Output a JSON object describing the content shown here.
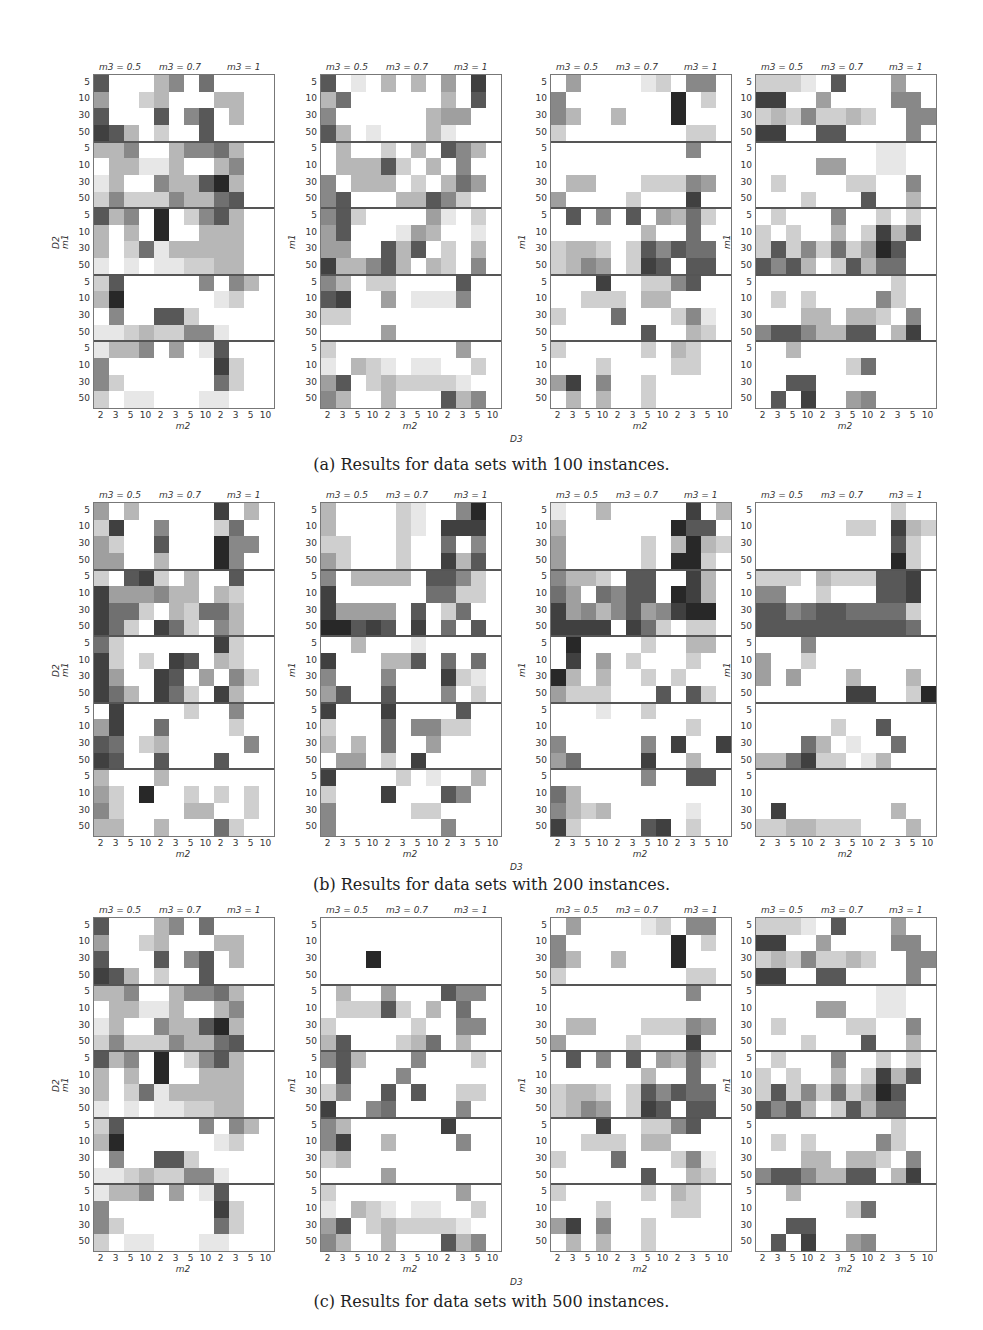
{
  "chart_data": {
    "type": "heatmap",
    "x_axis": {
      "label": "m2",
      "tick_labels": [
        "2",
        "3",
        "5",
        "10",
        "2",
        "3",
        "5",
        "10",
        "2",
        "3",
        "5",
        "10"
      ],
      "groups": [
        "m3 = 0.5",
        "m3 = 0.7",
        "m3 = 1"
      ]
    },
    "y_axis": {
      "label": "m1",
      "outer_label": "D2",
      "tick_labels": [
        "5",
        "10",
        "30",
        "50"
      ],
      "blocks": 5
    },
    "shared_xlabel": "D3",
    "figures": [
      {
        "id": "a",
        "caption": "(a) Results for data sets with 100 instances.",
        "panels": [
          {
            "rows": [
              "700035060000",
              "400230003300",
              "700070570300",
              "873020070000",
              "335003556300",
              "033113003500",
              "130053379300",
              "252225336700",
              "735090257300",
              "303090033300",
              "302613333300",
              "101011223300",
              "270000050530",
              "390000001200",
              "050077200000",
              "112322551000",
              "133504017000",
              "500000008200",
              "520000006200",
              "201100011000"
            ]
          },
          {
            "rows": [
              "701030304080",
              "360000003070",
              "500000034400",
              "730100031000",
              "030020307530",
              "033372030500",
              "503330203640",
              "570003375200",
              "572000041020",
              "470001430010",
              "440073702030",
              "833573032050",
              "530220000700",
              "780040111500",
              "220000000000",
              "000040000000",
              "200000000400",
              "103210110020",
              "470232222100",
              "530030007350"
            ]
          },
          {
            "rows": [
              "040000120550",
              "500000009020",
              "530030009000",
              "200000000220",
              "000000000500",
              "000000000000",
              "033000222540",
              "400002000800",
              "070507043620",
              "000000300600",
              "233202757660",
              "235402870770",
              "000800225700",
              "002220330000",
              "200060002510",
              "000000700320",
              "200000203200",
              "000200002200",
              "480500200000",
              "030300200000"
            ]
          },
          {
            "rows": [
              "222107000400",
              "880040000550",
              "232522320055",
              "880077000050",
              "000000001100",
              "000044001100",
              "020000220050",
              "000200070030",
              "020005002020",
              "202003028370",
              "272526249700",
              "757302736600",
              "000000000200",
              "020200005200",
              "000330332050",
              "577533770380",
              "003000000000",
              "000000260000",
              "007700000000",
              "070800450000"
            ]
          }
        ]
      },
      {
        "id": "b",
        "caption": "(b) Results for data sets with 200 instances.",
        "panels": [
          {
            "rows": [
              "403000008030",
              "280050002600",
              "420070009550",
              "440030009500",
              "207820300700",
              "844453303200",
              "866203266300",
              "862086205300",
              "620000008200",
              "820208703200",
              "840087040520",
              "863086208300",
              "080000200500",
              "480060000200",
              "760230000050",
              "870070007000",
              "300030000000",
              "420900202020",
              "520000330020",
              "330030006200"
            ]
          },
          {
            "rows": [
              "300002100590",
              "300002108880",
              "220002006050",
              "420002008370",
              "503333077520",
              "800000066220",
              "844440702600",
              "997870806070",
              "003000100000",
              "800033706060",
              "500050008210",
              "470070005020",
              "800080000700",
              "200060552200",
              "303060040000",
              "044020800000",
              "800002010030",
              "200080007500",
              "500000220000",
              "500000005000"
            ]
          },
          {
            "rows": [
              "100300000803",
              "300000009770",
              "400000203932",
              "400000209920",
              "533207700830",
              "640657709830",
              "845357458990",
              "888808620220",
              "090000200330",
              "080402000200",
              "930300202000",
              "422200070720",
              "000100200000",
              "000000000200",
              "500000508008",
              "460000800300",
              "000000500770",
              "630000000000",
              "532300000100",
              "820000780200"
            ]
          },
          {
            "rows": [
              "000000000200",
              "000000220832",
              "000000000720",
              "000000000920",
              "222032227780",
              "550020007780",
              "775677666620",
              "777777777760",
              "000500000000",
              "400200000000",
              "404000300030",
              "000000880029",
              "000000000000",
              "000002007000",
              "000630100600",
              "336822013000",
              "000000000000",
              "000000000000",
              "080000000300",
              "223322200030"
            ]
          }
        ]
      },
      {
        "id": "c",
        "caption": "(c) Results for data sets with 500 instances.",
        "panels": [
          {
            "rows": [
              "700035060000",
              "400230003300",
              "700070570300",
              "873020070000",
              "335003556300",
              "033113003500",
              "130053379300",
              "252225336700",
              "735090257300",
              "303090033300",
              "302613333300",
              "101011223300",
              "270000050530",
              "390000001200",
              "050077200000",
              "112322551000",
              "133504017000",
              "500000008200",
              "520000006200",
              "201100011000"
            ]
          },
          {
            "rows": [
              "000000000000",
              "000000000000",
              "000900000000",
              "000000000000",
              "030040007550",
              "022272030600",
              "200000200550",
              "370002360300",
              "573000500020",
              "070005000000",
              "250070700220",
              "800560000500",
              "530000008000",
              "580030000500",
              "230000000000",
              "000040000000",
              "200000000400",
              "103210110020",
              "470232222100",
              "530030007350"
            ]
          },
          {
            "rows": [
              "040000120550",
              "500000009020",
              "530030009000",
              "200000000220",
              "000000000500",
              "000000000000",
              "033000222540",
              "400002000800",
              "070507043620",
              "000000300600",
              "233202757660",
              "235402870770",
              "000800225700",
              "002220330000",
              "200060002510",
              "000000700320",
              "200000203200",
              "000200002200",
              "480500200000",
              "030300200000"
            ]
          },
          {
            "rows": [
              "222107000400",
              "880040000550",
              "232522320055",
              "880077000050",
              "000000001100",
              "000044001100",
              "020000220050",
              "000200070030",
              "020005002020",
              "202003028370",
              "272526249700",
              "757302736600",
              "000000000200",
              "020200005200",
              "000330332050",
              "577533770380",
              "003000000000",
              "000000260000",
              "007700000000",
              "070800450000"
            ]
          }
        ]
      }
    ]
  },
  "labels": {
    "m3_groups": [
      "m3 = 0.5",
      "m3 = 0.7",
      "m3 = 1"
    ],
    "x_ticks": [
      "2",
      "3",
      "5",
      "10",
      "2",
      "3",
      "5",
      "10",
      "2",
      "3",
      "5",
      "10"
    ],
    "y_ticks": [
      "5",
      "10",
      "30",
      "50"
    ],
    "x_title": "m2",
    "y_title": "m1",
    "outer_y_title": "D2",
    "bottom_title": "D3"
  },
  "captions": {
    "a": "(a) Results for data sets with 100 instances.",
    "b": "(b) Results for data sets with 200 instances.",
    "c": "(c) Results for data sets with 500 instances."
  },
  "colors": {
    "max": "#2b2b2b",
    "min": "#ffffff",
    "separator": "#555555"
  }
}
